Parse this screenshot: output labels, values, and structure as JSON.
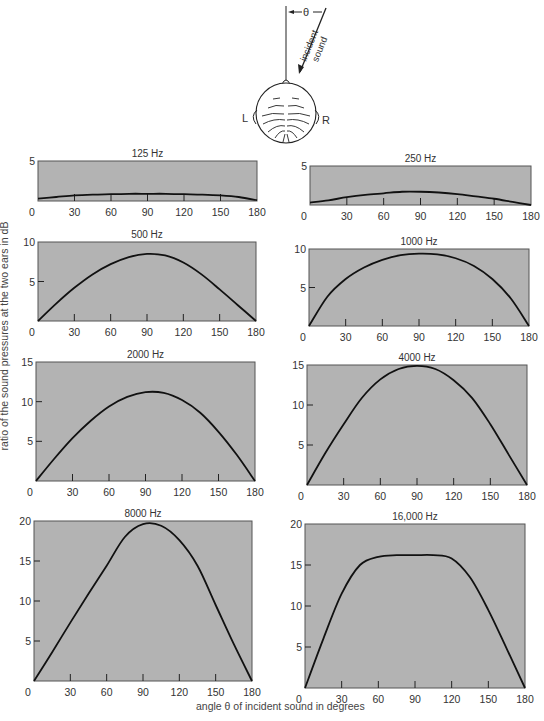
{
  "figure": {
    "ylabel": "ratio of the sound pressures at the two ears in dB",
    "xlabel": "angle θ of incident sound in degrees",
    "diagram": {
      "theta_label": "θ",
      "arrow_label_line1": "incident",
      "arrow_label_line2": "sound",
      "left_ear": "L",
      "right_ear": "R"
    },
    "colors": {
      "plot_bg": "#b3b3b3",
      "curve": "#111111",
      "frame": "#555555"
    }
  },
  "chart_data": [
    {
      "type": "line",
      "title": "125 Hz",
      "xlabel": "",
      "ylabel": "",
      "x": [
        0,
        15,
        30,
        45,
        60,
        75,
        90,
        105,
        120,
        135,
        150,
        165,
        180
      ],
      "values": [
        0.3,
        0.5,
        0.7,
        0.8,
        0.85,
        0.9,
        0.9,
        0.9,
        0.85,
        0.8,
        0.7,
        0.5,
        0.1
      ],
      "xticks": [
        0,
        30,
        60,
        90,
        120,
        150,
        180
      ],
      "yticks": [
        0,
        5
      ],
      "ylim": [
        0,
        5
      ],
      "xlim": [
        0,
        180
      ],
      "grid": false
    },
    {
      "type": "line",
      "title": "250 Hz",
      "xlabel": "",
      "ylabel": "",
      "x": [
        0,
        15,
        30,
        45,
        60,
        75,
        90,
        105,
        120,
        135,
        150,
        165,
        180
      ],
      "values": [
        0.3,
        0.6,
        1.0,
        1.3,
        1.5,
        1.7,
        1.7,
        1.6,
        1.4,
        1.1,
        0.8,
        0.4,
        0.0
      ],
      "xticks": [
        0,
        30,
        60,
        90,
        120,
        150,
        180
      ],
      "yticks": [
        0,
        5
      ],
      "ylim": [
        0,
        5
      ],
      "xlim": [
        0,
        180
      ],
      "grid": false
    },
    {
      "type": "line",
      "title": "500 Hz",
      "xlabel": "",
      "ylabel": "",
      "x": [
        0,
        15,
        30,
        45,
        60,
        75,
        90,
        105,
        120,
        135,
        150,
        165,
        180
      ],
      "values": [
        0,
        2.2,
        4.2,
        5.9,
        7.2,
        8.1,
        8.5,
        8.3,
        7.4,
        5.9,
        4.0,
        2.0,
        0
      ],
      "xticks": [
        0,
        30,
        60,
        90,
        120,
        150,
        180
      ],
      "yticks": [
        0,
        5,
        10
      ],
      "ylim": [
        0,
        10
      ],
      "xlim": [
        0,
        180
      ],
      "grid": false
    },
    {
      "type": "line",
      "title": "1000 Hz",
      "xlabel": "",
      "ylabel": "",
      "x": [
        0,
        15,
        30,
        45,
        60,
        75,
        90,
        105,
        120,
        135,
        150,
        165,
        180
      ],
      "values": [
        0,
        3.8,
        6.1,
        7.6,
        8.6,
        9.2,
        9.4,
        9.3,
        8.8,
        7.8,
        6.1,
        3.6,
        0
      ],
      "xticks": [
        0,
        30,
        60,
        90,
        120,
        150,
        180
      ],
      "yticks": [
        0,
        5,
        10
      ],
      "ylim": [
        0,
        10
      ],
      "xlim": [
        0,
        180
      ],
      "grid": false
    },
    {
      "type": "line",
      "title": "2000 Hz",
      "xlabel": "",
      "ylabel": "",
      "x": [
        0,
        15,
        30,
        45,
        60,
        75,
        90,
        105,
        120,
        135,
        150,
        165,
        180
      ],
      "values": [
        0,
        2.8,
        5.4,
        7.6,
        9.4,
        10.6,
        11.2,
        11.1,
        10.2,
        8.6,
        6.2,
        3.3,
        0
      ],
      "xticks": [
        0,
        30,
        60,
        90,
        120,
        150,
        180
      ],
      "yticks": [
        0,
        5,
        10,
        15
      ],
      "ylim": [
        0,
        15
      ],
      "xlim": [
        0,
        180
      ],
      "grid": false
    },
    {
      "type": "line",
      "title": "4000 Hz",
      "xlabel": "",
      "ylabel": "",
      "x": [
        0,
        15,
        30,
        45,
        60,
        75,
        90,
        105,
        120,
        135,
        150,
        165,
        180
      ],
      "values": [
        0,
        4.0,
        7.6,
        10.9,
        13.2,
        14.5,
        14.9,
        14.5,
        13.1,
        10.9,
        7.6,
        3.8,
        0
      ],
      "xticks": [
        0,
        30,
        60,
        90,
        120,
        150,
        180
      ],
      "yticks": [
        0,
        5,
        10,
        15
      ],
      "ylim": [
        0,
        15
      ],
      "xlim": [
        0,
        180
      ],
      "grid": false
    },
    {
      "type": "line",
      "title": "8000 Hz",
      "xlabel": "",
      "ylabel": "",
      "x": [
        0,
        15,
        30,
        45,
        60,
        75,
        90,
        105,
        120,
        135,
        150,
        165,
        180
      ],
      "values": [
        0,
        3.6,
        7.3,
        10.9,
        14.4,
        18.0,
        19.6,
        19.4,
        17.6,
        14.4,
        9.5,
        4.6,
        0
      ],
      "xticks": [
        0,
        30,
        60,
        90,
        120,
        150,
        180
      ],
      "yticks": [
        0,
        5,
        10,
        15,
        20
      ],
      "ylim": [
        0,
        20
      ],
      "xlim": [
        0,
        180
      ],
      "grid": false
    },
    {
      "type": "line",
      "title": "16,000 Hz",
      "xlabel": "",
      "ylabel": "",
      "x": [
        0,
        15,
        30,
        45,
        60,
        75,
        90,
        105,
        120,
        135,
        150,
        165,
        180
      ],
      "values": [
        0,
        6.0,
        11.5,
        15.0,
        16.0,
        16.2,
        16.2,
        16.2,
        15.8,
        13.5,
        9.5,
        4.8,
        0
      ],
      "xticks": [
        0,
        30,
        60,
        90,
        120,
        150,
        180
      ],
      "yticks": [
        0,
        5,
        10,
        15,
        20
      ],
      "ylim": [
        0,
        20
      ],
      "xlim": [
        0,
        180
      ],
      "grid": false
    }
  ]
}
